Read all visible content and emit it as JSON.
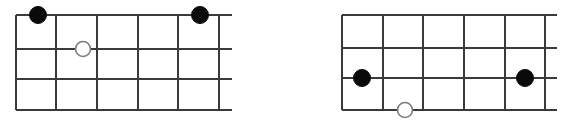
{
  "canvas": {
    "width": 570,
    "height": 120,
    "background": "#ffffff",
    "line_color": "#3a3a3a",
    "filled_node_color": "#0a0a0a",
    "open_node_fill": "#ffffff",
    "open_node_stroke": "#7a7a7a"
  },
  "diagrams": [
    {
      "id": "left-grid",
      "name": "left-grid-diagram",
      "rows": 3,
      "columns": 5,
      "x_left": 16,
      "x_right": 232,
      "y_top": 15,
      "y_bottom": 110,
      "vertical_lines_x": [
        16,
        56,
        97,
        138,
        178,
        219
      ],
      "horizontal_lines_y": [
        15,
        49,
        79,
        110
      ],
      "horizontal_line_x_start": 16,
      "horizontal_line_x_end": 232,
      "vertical_line_y_start": 15,
      "vertical_line_y_end": 110,
      "nodes": [
        {
          "id": "left-node-1",
          "type": "filled",
          "cx": 38,
          "cy": 15,
          "r": 8.5
        },
        {
          "id": "left-node-2",
          "type": "filled",
          "cx": 200,
          "cy": 15,
          "r": 8.5
        },
        {
          "id": "left-node-3",
          "type": "open",
          "cx": 83,
          "cy": 49,
          "r": 7.5
        }
      ]
    },
    {
      "id": "right-grid",
      "name": "right-grid-diagram",
      "rows": 3,
      "columns": 5,
      "x_left": 342,
      "x_right": 557,
      "y_top": 15,
      "y_bottom": 110,
      "vertical_lines_x": [
        342,
        383,
        423,
        464,
        505,
        545
      ],
      "horizontal_lines_y": [
        15,
        48,
        78,
        110
      ],
      "horizontal_line_x_start": 342,
      "horizontal_line_x_end": 557,
      "vertical_line_y_start": 15,
      "vertical_line_y_end": 110,
      "nodes": [
        {
          "id": "right-node-1",
          "type": "filled",
          "cx": 362,
          "cy": 78,
          "r": 8.5
        },
        {
          "id": "right-node-2",
          "type": "filled",
          "cx": 525,
          "cy": 78,
          "r": 8.5
        },
        {
          "id": "right-node-3",
          "type": "open",
          "cx": 405,
          "cy": 110,
          "r": 7.5
        }
      ]
    }
  ]
}
